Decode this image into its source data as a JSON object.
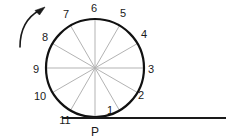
{
  "figure": {
    "type": "rolling-circle-diagram",
    "background_color": "#ffffff",
    "circle": {
      "center_x": 95,
      "center_y": 68,
      "radius": 49,
      "stroke_color": "#111111",
      "stroke_width": 2.2
    },
    "spokes": {
      "count": 12,
      "stroke_color": "#b3b3b3",
      "stroke_width": 1
    },
    "ground_line": {
      "x_start": 62,
      "x_end": 226,
      "y": 118,
      "stroke_color": "#1a1a1a",
      "stroke_width": 2
    },
    "rotation_arrow": {
      "direction": "counterclockwise",
      "stroke_color": "#1a1a1a",
      "stroke_width": 1.6
    },
    "contact_point": {
      "label": "P",
      "x": 95,
      "y": 118
    },
    "rim_labels": [
      {
        "text": "1",
        "x": 110,
        "y": 114,
        "angle_deg": 300
      },
      {
        "text": "2",
        "x": 141,
        "y": 99,
        "angle_deg": 330
      },
      {
        "text": "3",
        "x": 151,
        "y": 73,
        "angle_deg": 0
      },
      {
        "text": "4",
        "x": 144,
        "y": 38,
        "angle_deg": 30
      },
      {
        "text": "5",
        "x": 123,
        "y": 17,
        "angle_deg": 60
      },
      {
        "text": "6",
        "x": 94,
        "y": 12,
        "angle_deg": 90
      },
      {
        "text": "7",
        "x": 66,
        "y": 18,
        "angle_deg": 120
      },
      {
        "text": "8",
        "x": 45,
        "y": 41,
        "angle_deg": 150
      },
      {
        "text": "9",
        "x": 36,
        "y": 73,
        "angle_deg": 180
      },
      {
        "text": "10",
        "x": 40,
        "y": 100,
        "angle_deg": 210
      },
      {
        "text": "11",
        "x": 65,
        "y": 124,
        "angle_deg": 240
      }
    ]
  }
}
